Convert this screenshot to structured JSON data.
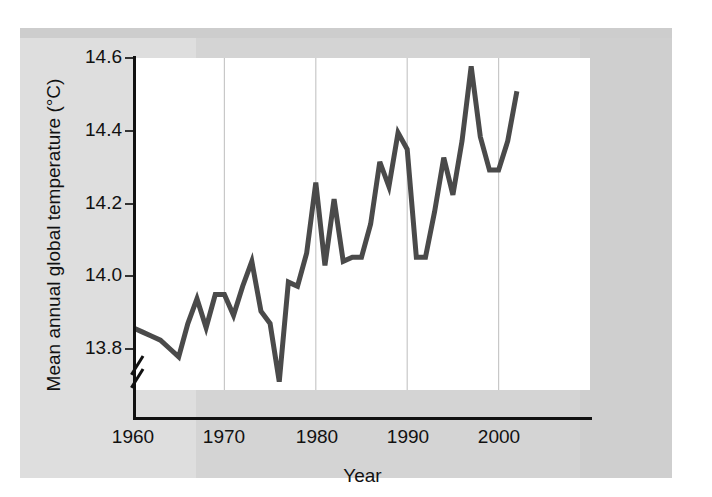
{
  "chart_data": {
    "type": "line",
    "title": "",
    "xlabel": "Year",
    "ylabel": "Mean annual global temperature (°C)",
    "xlim": [
      1960,
      2010
    ],
    "ylim": [
      13.8,
      14.6
    ],
    "xticks": [
      "1960",
      "1970",
      "1980",
      "1990",
      "2000"
    ],
    "xtick_values": [
      1960,
      1970,
      1980,
      1990,
      2000
    ],
    "yticks": [
      "13.8",
      "14.0",
      "14.2",
      "14.4",
      "14.6"
    ],
    "ytick_values": [
      13.8,
      14.0,
      14.2,
      14.4,
      14.6
    ],
    "y_axis_break": true,
    "grid": "vertical-only",
    "legend": "none",
    "line_color": "#4a4a4a",
    "x": [
      1960,
      1961,
      1962,
      1963,
      1964,
      1965,
      1966,
      1967,
      1968,
      1969,
      1970,
      1971,
      1972,
      1973,
      1974,
      1975,
      1976,
      1977,
      1978,
      1979,
      1980,
      1981,
      1982,
      1983,
      1984,
      1985,
      1986,
      1987,
      1988,
      1989,
      1990,
      1991,
      1992,
      1993,
      1994,
      1995,
      1996,
      1997,
      1998,
      1999,
      2000,
      2001,
      2002
    ],
    "values": [
      13.95,
      13.94,
      13.93,
      13.92,
      13.9,
      13.88,
      13.96,
      14.02,
      13.95,
      14.03,
      14.03,
      13.98,
      14.05,
      14.11,
      13.99,
      13.96,
      13.82,
      14.06,
      14.05,
      14.13,
      14.3,
      14.1,
      14.26,
      14.11,
      14.12,
      14.12,
      14.2,
      14.35,
      14.29,
      14.42,
      14.38,
      14.12,
      14.12,
      14.23,
      14.36,
      14.27,
      14.4,
      14.58,
      14.41,
      14.33,
      14.33,
      14.4,
      14.52
    ],
    "annotations": []
  },
  "axis": {
    "y_title": "Mean annual global temperature (°C)",
    "x_title": "Year",
    "y_labels": [
      "14.6",
      "14.4",
      "14.2",
      "14.0",
      "13.8"
    ],
    "x_labels": [
      "1960",
      "1970",
      "1980",
      "1990",
      "2000"
    ]
  }
}
